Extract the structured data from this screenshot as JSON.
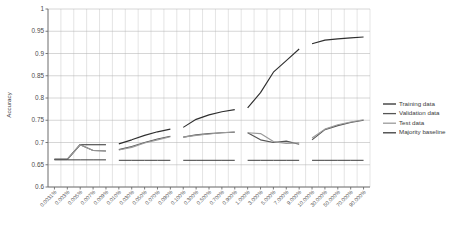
{
  "chart_data": {
    "type": "line",
    "title": "",
    "xlabel": "",
    "ylabel": "Accuracy",
    "ylim": [
      0.6,
      1
    ],
    "yticks": [
      "0.6",
      "0.65",
      "0.7",
      "0.75",
      "0.8",
      "0.85",
      "0.9",
      "0.95",
      "1"
    ],
    "ytick_values": [
      0.6,
      0.65,
      0.7,
      0.75,
      0.8,
      0.85,
      0.9,
      0.95,
      1
    ],
    "grid": true,
    "legend_position": "right",
    "categories": [
      "0.0031%",
      "0.003%",
      "0.005%",
      "0.007%",
      "0.009%",
      "0.010%",
      "0.030%",
      "0.050%",
      "0.070%",
      "0.090%",
      "0.100%",
      "0.300%",
      "0.500%",
      "0.700%",
      "0.900%",
      "1.000%",
      "3.000%",
      "5.000%",
      "7.000%",
      "9.000%",
      "10.000%",
      "30.000%",
      "50.000%",
      "70.000%",
      "90.000%"
    ],
    "segments": [
      {
        "name": "decade-1",
        "start_index": 0,
        "end_index": 4
      },
      {
        "name": "decade-2",
        "start_index": 5,
        "end_index": 9
      },
      {
        "name": "decade-3",
        "start_index": 10,
        "end_index": 14
      },
      {
        "name": "decade-4",
        "start_index": 15,
        "end_index": 19
      },
      {
        "name": "decade-5",
        "start_index": 20,
        "end_index": 24
      }
    ],
    "series": [
      {
        "name": "Training data",
        "color": "#2f2f2f",
        "values": [
          0.662,
          0.662,
          0.695,
          0.695,
          0.695,
          0.697,
          0.706,
          0.716,
          0.724,
          0.73,
          0.734,
          0.752,
          0.762,
          0.769,
          0.774,
          0.778,
          0.812,
          0.858,
          0.884,
          0.91,
          0.922,
          0.93,
          0.933,
          0.935,
          0.937
        ]
      },
      {
        "name": "Validation data",
        "color": "#555555",
        "values": [
          0.662,
          0.662,
          0.695,
          0.682,
          0.681,
          0.684,
          0.691,
          0.7,
          0.708,
          0.714,
          0.712,
          0.717,
          0.72,
          0.722,
          0.723,
          0.722,
          0.706,
          0.7,
          0.703,
          0.696,
          0.706,
          0.729,
          0.738,
          0.745,
          0.75
        ]
      },
      {
        "name": "Test data",
        "color": "#9a9a9a",
        "values": [
          0.662,
          0.662,
          0.695,
          0.682,
          0.681,
          0.683,
          0.689,
          0.699,
          0.706,
          0.713,
          0.712,
          0.716,
          0.719,
          0.722,
          0.724,
          0.722,
          0.72,
          0.702,
          0.698,
          0.699,
          0.71,
          0.73,
          0.74,
          0.746,
          0.751
        ]
      },
      {
        "name": "Majority baseline",
        "color": "#3c3c3c",
        "values": [
          0.661,
          0.661,
          0.661,
          0.661,
          0.661,
          0.66,
          0.66,
          0.66,
          0.66,
          0.66,
          0.66,
          0.66,
          0.66,
          0.66,
          0.66,
          0.66,
          0.66,
          0.66,
          0.66,
          0.66,
          0.66,
          0.66,
          0.66,
          0.66,
          0.66
        ]
      }
    ],
    "legend": [
      {
        "label": "Training data",
        "color": "#2f2f2f"
      },
      {
        "label": "Validation data",
        "color": "#555555"
      },
      {
        "label": "Test data",
        "color": "#9a9a9a"
      },
      {
        "label": "Majority baseline",
        "color": "#3c3c3c"
      }
    ]
  }
}
